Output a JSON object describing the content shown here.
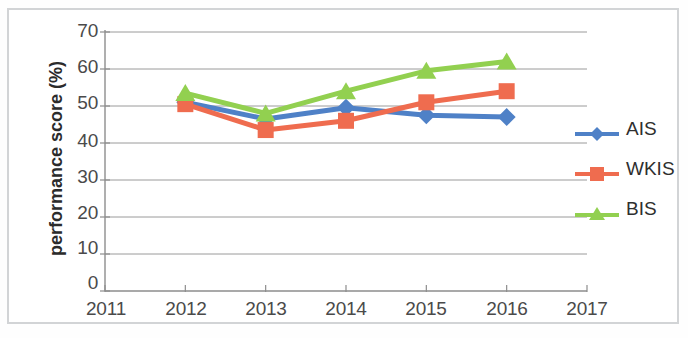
{
  "chart_data": {
    "type": "line",
    "title": "",
    "subtitle": "",
    "xlabel": "",
    "ylabel": "performance score (%)",
    "x": [
      2012,
      2013,
      2014,
      2015,
      2016
    ],
    "xlim": [
      2011,
      2017
    ],
    "ylim": [
      0,
      70
    ],
    "y_tick_step": 10,
    "grid": true,
    "grid_axis": "y",
    "legend_position": "right",
    "x_tick_labels": [
      "2011",
      "2012",
      "2013",
      "2014",
      "2015",
      "2016",
      "2017"
    ],
    "y_tick_labels": [
      "70",
      "60",
      "50",
      "40",
      "30",
      "20",
      "10",
      "0"
    ],
    "series": [
      {
        "name": "AIS",
        "color": "#4f81c7",
        "marker": "diamond",
        "values": [
          51,
          46.5,
          49.5,
          47.5,
          47
        ]
      },
      {
        "name": "WKIS",
        "color": "#ef6c4f",
        "marker": "square",
        "values": [
          50.5,
          43.5,
          46,
          51,
          54
        ]
      },
      {
        "name": "BIS",
        "color": "#92d050",
        "marker": "triangle",
        "values": [
          53.5,
          48,
          54,
          59.5,
          62
        ]
      }
    ]
  },
  "legend": {
    "items": [
      {
        "label": "AIS",
        "color": "#4f81c7",
        "marker": "diamond"
      },
      {
        "label": "WKIS",
        "color": "#ef6c4f",
        "marker": "square"
      },
      {
        "label": "BIS",
        "color": "#92d050",
        "marker": "triangle"
      }
    ]
  },
  "colors": {
    "ais": "#4f81c7",
    "wkis": "#ef6c4f",
    "bis": "#92d050",
    "grid": "#9a9a9a",
    "axis": "#8d8d8d",
    "frame": "#d2d4d6",
    "tick_text": "#4a4a4a",
    "title_text": "#2b2b2b"
  }
}
